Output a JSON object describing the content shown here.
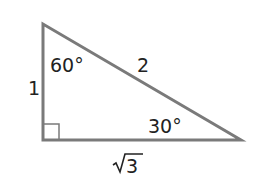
{
  "diagram": {
    "type": "right-triangle",
    "vertices": {
      "top": [
        43,
        24
      ],
      "right_angle": [
        43,
        140
      ],
      "right": [
        241,
        140
      ]
    },
    "stroke_color": "#7a7a7a",
    "text_color": "#222222",
    "sides": {
      "short_leg": "1",
      "hypotenuse": "2",
      "long_leg_radical": "√",
      "long_leg_value": "3"
    },
    "angles": {
      "top_angle": "60°",
      "right_angle_value": "30°"
    },
    "right_angle_marker": true
  }
}
